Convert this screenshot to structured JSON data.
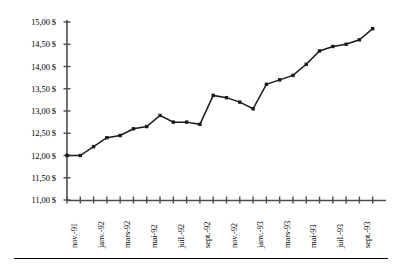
{
  "chart_data": {
    "type": "line",
    "title": "",
    "subtitle": "",
    "xlabel": "",
    "ylabel": "",
    "grid": false,
    "legend": "none",
    "ylim": [
      11.0,
      15.0
    ],
    "ytick_step": 0.5,
    "ytick_labels": [
      "15,00 $",
      "14,50 $",
      "14,00 $",
      "13,50 $",
      "13,00 $",
      "12,50 $",
      "12,00 $",
      "11,50 $",
      "11,00 $"
    ],
    "ytick_values": [
      15.0,
      14.5,
      14.0,
      13.5,
      13.0,
      12.5,
      12.0,
      11.5,
      11.0
    ],
    "currency_symbol": "$",
    "decimal_separator": ",",
    "x_tick_count": 24,
    "x_label_interval": 2,
    "xtick_labels": [
      "nov.-91",
      "janv.-92",
      "mars-92",
      "mai-92",
      "juil.-92",
      "sept.-92",
      "nov.-92",
      "janv.-93",
      "mars-93",
      "mai-93",
      "juil.-93",
      "sept.-93"
    ],
    "categories": [
      "nov.-91",
      "dec.-91",
      "janv.-92",
      "fevr.-92",
      "mars-92",
      "avr.-92",
      "mai-92",
      "juin-92",
      "juil.-92",
      "aout-92",
      "sept.-92",
      "oct.-92",
      "nov.-92",
      "dec.-92",
      "janv.-93",
      "fevr.-93",
      "mars-93",
      "avr.-93",
      "mai-93",
      "juin-93",
      "juil.-93",
      "aout-93",
      "sept.-93",
      "oct.-93"
    ],
    "values": [
      12.0,
      12.0,
      12.2,
      12.4,
      12.45,
      12.6,
      12.65,
      12.9,
      12.75,
      12.75,
      12.7,
      13.35,
      13.3,
      13.2,
      13.05,
      13.6,
      13.7,
      13.8,
      14.05,
      14.35,
      14.45,
      14.5,
      14.6,
      14.85
    ],
    "series_name": "",
    "line_color": "#1a1a1a",
    "marker_color": "#1a1a1a",
    "marker_shape": "square",
    "axis_color": "#4d4d4d"
  }
}
